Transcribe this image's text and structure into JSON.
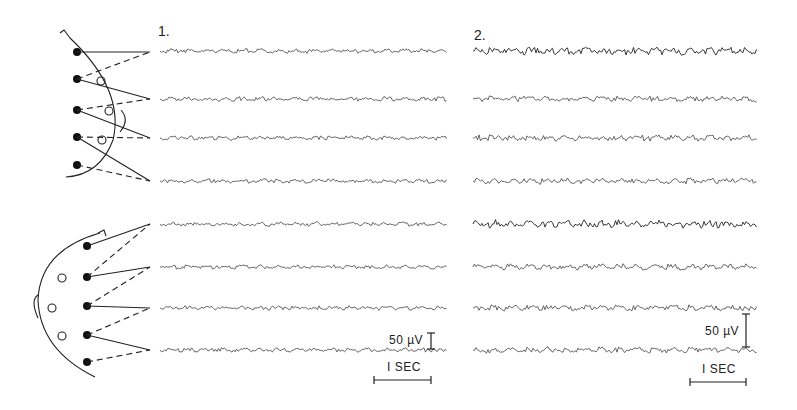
{
  "figure": {
    "panels": [
      {
        "id": "1",
        "label": "1.",
        "x": 160
      },
      {
        "id": "2",
        "label": "2.",
        "x": 473
      }
    ],
    "montages": [
      {
        "name": "lateral-montage",
        "view": "side of head",
        "electrodes_filled": 5,
        "electrodes_open": 3,
        "channels": 4
      },
      {
        "name": "coronal-montage",
        "view": "top of head",
        "electrodes_filled": 5,
        "electrodes_open": 3,
        "channels": 4
      }
    ],
    "traces": {
      "baselines_y": [
        51,
        99,
        138,
        181,
        224,
        267,
        308,
        350
      ],
      "panel1_x": [
        160,
        447
      ],
      "panel2_x": [
        473,
        757
      ]
    },
    "scale_bars": [
      {
        "panel": "1",
        "amplitude_label": "50 µV",
        "time_label": "I SEC"
      },
      {
        "panel": "2",
        "amplitude_label": "50 µV",
        "time_label": "I SEC"
      }
    ],
    "colors": {
      "ink": "#222222",
      "background": "#ffffff",
      "trace": "#555555"
    }
  }
}
